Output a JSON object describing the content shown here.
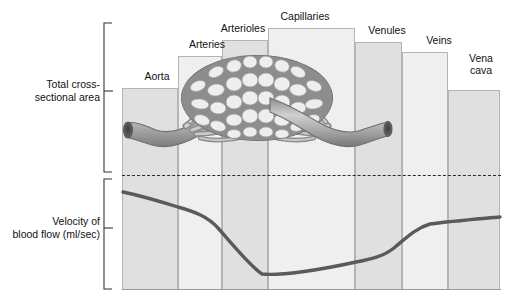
{
  "figure": {
    "axis_labels": {
      "top": "Total cross-\nsectional area",
      "bottom": "Velocity of\nblood flow (ml/sec)"
    },
    "illustration_name": "blood-vessel-network-illustration",
    "colors": {
      "bar_light": "#efefef",
      "bar_dark": "#e0e0e0",
      "bar_border": "#b4b4b4",
      "curve": "#555555",
      "dashed_divider": "#2a2a2a",
      "text": "#111111"
    }
  },
  "chart_data": {
    "type": "bar",
    "title": "",
    "xlabel": "",
    "ylabel": "Total cross-sectional area",
    "categories": [
      "Aorta",
      "Arteries",
      "Arterioles",
      "Capillaries",
      "Venules",
      "Veins",
      "Vena cava"
    ],
    "values": [
      28,
      47,
      58,
      67,
      56,
      50,
      30
    ],
    "ylim": [
      0,
      100
    ],
    "grid": false,
    "legend": null,
    "annotations": [
      "Total cross-sectional area is greatest at the capillaries",
      "Velocity of blood flow is lowest at the capillaries"
    ],
    "series": [
      {
        "name": "Total cross-sectional area",
        "type": "bar",
        "values": [
          28,
          47,
          58,
          67,
          56,
          50,
          30
        ]
      },
      {
        "name": "Velocity of blood flow (ml/sec)",
        "type": "line",
        "categories": [
          "Aorta",
          "Arteries",
          "Arterioles",
          "Capillaries",
          "Venules",
          "Veins",
          "Vena cava"
        ],
        "values": [
          86,
          72,
          30,
          14,
          22,
          58,
          64
        ]
      }
    ]
  },
  "columns": [
    {
      "label": "Aorta",
      "label_lines": "Aorta",
      "x": 0,
      "w": 56,
      "bar_top": 66,
      "shade": "dark",
      "label_x": 6,
      "label_y": 48
    },
    {
      "label": "Arteries",
      "label_lines": "Arteries",
      "x": 56,
      "w": 44,
      "bar_top": 34,
      "shade": "light",
      "label_x": 56,
      "label_y": 16
    },
    {
      "label": "Arterioles",
      "label_lines": "Arterioles",
      "x": 100,
      "w": 46,
      "bar_top": 18,
      "shade": "dark",
      "label_x": 92,
      "label_y": 0
    },
    {
      "label": "Capillaries",
      "label_lines": "Capillaries",
      "x": 146,
      "w": 87,
      "bar_top": 6,
      "shade": "light",
      "label_x": 154,
      "label_y": -12
    },
    {
      "label": "Venules",
      "label_lines": "Venules",
      "x": 233,
      "w": 47,
      "bar_top": 20,
      "shade": "dark",
      "label_x": 236,
      "label_y": 2
    },
    {
      "label": "Veins",
      "label_lines": "Veins",
      "x": 280,
      "w": 46,
      "bar_top": 30,
      "shade": "light",
      "label_x": 288,
      "label_y": 12
    },
    {
      "label": "Vena cava",
      "label_lines": "Vena\ncava",
      "x": 326,
      "w": 52,
      "bar_top": 68,
      "shade": "dark",
      "label_x": 330,
      "label_y": 30
    }
  ]
}
